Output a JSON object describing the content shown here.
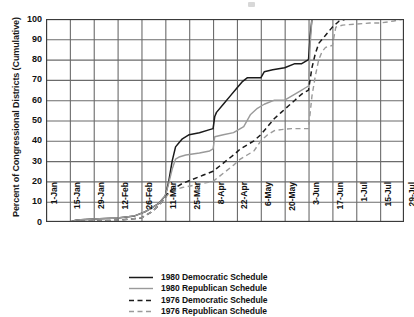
{
  "axes": {
    "ylabel": "Percent of Congressional Districts (Cumulative)",
    "xlabel": "",
    "yticks": [
      "100",
      "90",
      "80",
      "70",
      "60",
      "50",
      "40",
      "30",
      "20",
      "10",
      "0"
    ],
    "xticks": [
      "1-Jan",
      "15-Jan",
      "29-Jan",
      "12-Feb",
      "26-Feb",
      "11-Mar",
      "25-Mar",
      "8-Apr",
      "22-Apr",
      "6-May",
      "20-May",
      "3-Jun",
      "17-Jun",
      "1-Jul",
      "15-Jul",
      "29-Jul"
    ]
  },
  "legend": {
    "items": [
      {
        "label": "1980 Democratic Schedule",
        "style": "solid",
        "color": "#1a1a1a"
      },
      {
        "label": "1980 Republican Schedule",
        "style": "solid",
        "color": "#9a9a9a"
      },
      {
        "label": "1976 Democratic Schedule",
        "style": "dashed",
        "color": "#1a1a1a"
      },
      {
        "label": "1976 Republican Schedule",
        "style": "dashed",
        "color": "#9a9a9a"
      }
    ]
  },
  "colors": {
    "dark": "#1a1a1a",
    "gray": "#9a9a9a",
    "grid": "#6b6b6b",
    "frame": "#3a3a3a",
    "background": "#ffffff"
  },
  "chart_data": {
    "type": "line",
    "title": "",
    "xlabel": "",
    "ylabel": "Percent of Congressional Districts (Cumulative)",
    "xlim": [
      0,
      210
    ],
    "ylim": [
      0,
      100
    ],
    "grid": true,
    "legend_position": "bottom",
    "x_unit": "days from 1-Jan",
    "x_tick_days": [
      0,
      14,
      28,
      42,
      56,
      70,
      84,
      98,
      112,
      126,
      140,
      154,
      168,
      182,
      196,
      210
    ],
    "x_tick_labels": [
      "1-Jan",
      "15-Jan",
      "29-Jan",
      "12-Feb",
      "26-Feb",
      "11-Mar",
      "25-Mar",
      "8-Apr",
      "22-Apr",
      "6-May",
      "20-May",
      "3-Jun",
      "17-Jun",
      "1-Jul",
      "15-Jul",
      "29-Jul"
    ],
    "series": [
      {
        "name": "1980 Democratic Schedule",
        "style": "solid",
        "color": "#1a1a1a",
        "points": [
          [
            0,
            0
          ],
          [
            14,
            0
          ],
          [
            18,
            1
          ],
          [
            28,
            1.5
          ],
          [
            42,
            2
          ],
          [
            52,
            3
          ],
          [
            58,
            5
          ],
          [
            62,
            7
          ],
          [
            66,
            9
          ],
          [
            68,
            11
          ],
          [
            70,
            13
          ],
          [
            72,
            20
          ],
          [
            74,
            30
          ],
          [
            76,
            37
          ],
          [
            78,
            39
          ],
          [
            80,
            41
          ],
          [
            84,
            43
          ],
          [
            90,
            44
          ],
          [
            96,
            45.5
          ],
          [
            98,
            46
          ],
          [
            99,
            52
          ],
          [
            100,
            54
          ],
          [
            104,
            58
          ],
          [
            108,
            62
          ],
          [
            112,
            66
          ],
          [
            115,
            69
          ],
          [
            118,
            71
          ],
          [
            126,
            71
          ],
          [
            128,
            74
          ],
          [
            133,
            75
          ],
          [
            140,
            76
          ],
          [
            146,
            78
          ],
          [
            150,
            78
          ],
          [
            152,
            79
          ],
          [
            154,
            80
          ],
          [
            155,
            92
          ],
          [
            156,
            100
          ],
          [
            210,
            100
          ]
        ]
      },
      {
        "name": "1980 Republican Schedule",
        "style": "solid",
        "color": "#9a9a9a",
        "points": [
          [
            0,
            0
          ],
          [
            14,
            0
          ],
          [
            18,
            1
          ],
          [
            28,
            1.5
          ],
          [
            42,
            2
          ],
          [
            52,
            3
          ],
          [
            58,
            5
          ],
          [
            62,
            7
          ],
          [
            66,
            9
          ],
          [
            68,
            11
          ],
          [
            70,
            13
          ],
          [
            72,
            19
          ],
          [
            74,
            26
          ],
          [
            76,
            31
          ],
          [
            78,
            32
          ],
          [
            82,
            33
          ],
          [
            90,
            34
          ],
          [
            96,
            35
          ],
          [
            98,
            36
          ],
          [
            99,
            42
          ],
          [
            104,
            43
          ],
          [
            110,
            44
          ],
          [
            116,
            47
          ],
          [
            120,
            53
          ],
          [
            124,
            56
          ],
          [
            128,
            58
          ],
          [
            134,
            60
          ],
          [
            140,
            60
          ],
          [
            146,
            63
          ],
          [
            150,
            65
          ],
          [
            152,
            66
          ],
          [
            154,
            67
          ],
          [
            155,
            88
          ],
          [
            156,
            100
          ],
          [
            210,
            100
          ]
        ]
      },
      {
        "name": "1976 Democratic Schedule",
        "style": "dashed",
        "color": "#1a1a1a",
        "points": [
          [
            0,
            0
          ],
          [
            14,
            0
          ],
          [
            30,
            0.5
          ],
          [
            44,
            1
          ],
          [
            56,
            2
          ],
          [
            62,
            5
          ],
          [
            66,
            8
          ],
          [
            68,
            10
          ],
          [
            70,
            12
          ],
          [
            72,
            15
          ],
          [
            76,
            17
          ],
          [
            80,
            19
          ],
          [
            86,
            21
          ],
          [
            92,
            23
          ],
          [
            98,
            25
          ],
          [
            104,
            29
          ],
          [
            110,
            33
          ],
          [
            114,
            36
          ],
          [
            118,
            38
          ],
          [
            122,
            40
          ],
          [
            126,
            43
          ],
          [
            130,
            47
          ],
          [
            134,
            51
          ],
          [
            138,
            54
          ],
          [
            142,
            57
          ],
          [
            146,
            60
          ],
          [
            150,
            63
          ],
          [
            154,
            65
          ],
          [
            156,
            76
          ],
          [
            158,
            83
          ],
          [
            160,
            88
          ],
          [
            164,
            92
          ],
          [
            168,
            96
          ],
          [
            172,
            99
          ],
          [
            176,
            100
          ],
          [
            210,
            100
          ]
        ]
      },
      {
        "name": "1976 Republican Schedule",
        "style": "dashed",
        "color": "#9a9a9a",
        "points": [
          [
            0,
            0
          ],
          [
            14,
            0
          ],
          [
            30,
            0.5
          ],
          [
            44,
            1
          ],
          [
            56,
            2
          ],
          [
            62,
            5
          ],
          [
            66,
            8
          ],
          [
            68,
            10
          ],
          [
            70,
            12
          ],
          [
            72,
            14
          ],
          [
            76,
            16
          ],
          [
            80,
            17
          ],
          [
            86,
            18
          ],
          [
            92,
            19
          ],
          [
            98,
            20
          ],
          [
            104,
            24
          ],
          [
            110,
            28
          ],
          [
            114,
            31
          ],
          [
            118,
            33
          ],
          [
            122,
            35
          ],
          [
            126,
            40
          ],
          [
            130,
            43
          ],
          [
            134,
            45
          ],
          [
            138,
            45.5
          ],
          [
            144,
            46
          ],
          [
            150,
            46
          ],
          [
            154,
            46
          ],
          [
            156,
            62
          ],
          [
            158,
            72
          ],
          [
            160,
            80
          ],
          [
            162,
            84
          ],
          [
            164,
            86
          ],
          [
            168,
            87
          ],
          [
            170,
            96
          ],
          [
            174,
            97
          ],
          [
            182,
            97.5
          ],
          [
            190,
            98
          ],
          [
            196,
            98
          ],
          [
            204,
            99
          ],
          [
            210,
            100
          ]
        ]
      }
    ]
  }
}
